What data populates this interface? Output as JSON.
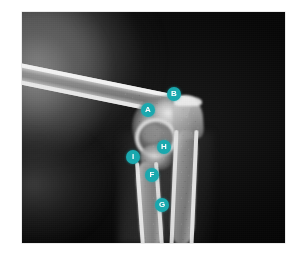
{
  "page": {
    "background_color": "#ffffff",
    "width": 301,
    "height": 262
  },
  "radiograph": {
    "name": "elbow-radiograph",
    "alt_text": "Lateral radiograph of an elbow joint with labelled anatomical landmarks",
    "frame": {
      "left": 22,
      "top": 12,
      "width": 263,
      "height": 231
    },
    "background_color": "#000000"
  },
  "annotations": {
    "marker_color": "#1aa8ae",
    "label_color": "#ffffff",
    "marker_diameter": 14,
    "items": [
      {
        "label": "A",
        "name": "marker-a",
        "x": 141,
        "y": 103
      },
      {
        "label": "B",
        "name": "marker-b",
        "x": 167,
        "y": 87
      },
      {
        "label": "H",
        "name": "marker-h",
        "x": 157,
        "y": 140
      },
      {
        "label": "I",
        "name": "marker-i",
        "x": 126,
        "y": 150
      },
      {
        "label": "F",
        "name": "marker-f",
        "x": 145,
        "y": 168
      },
      {
        "label": "G",
        "name": "marker-g",
        "x": 155,
        "y": 198
      }
    ]
  }
}
